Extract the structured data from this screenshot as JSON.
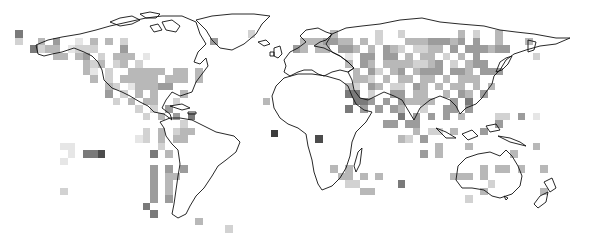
{
  "map": {
    "title": "",
    "projection": "equirectangular world map",
    "legend": null,
    "grid": {
      "cell_size_px": 7.5,
      "origin_px": [
        0,
        0
      ],
      "levels": {
        ".": "#ffffff",
        "1": "#e6e6e6",
        "2": "#d2d2d2",
        "3": "#b8b8b8",
        "4": "#9c9c9c",
        "5": "#7a7a7a",
        "6": "#4c4c4c"
      },
      "rows": [
        "...............................................................................",
        "...............................................................................",
        "...............................................................................",
        "...............................................................................",
        "..5..............................2..........3.....2..2.......3.2..3............",
        "..2..3.4..1.3.3.2...........4...........3334433.3.2...33344434.4..3...3........",
        "....5233.1222...4......................43.33.443.3.432.2233.4.444344...........",
        ".......33.34.2.333.1..........................1.44.44.3.33.2.3.4.......2........",
        "...........323.23.2...........................3.43.33332234.2.344.....................",
        "...........31.2..33333.33.3....................3.42.34.3444.443.444...............",
        "............3.2.33333.333.3....................332.3.33.33.3.333.....................",
        "..............32.133344.......................32.43.22.43.3.33.3.3...................",
        "..............4.2.3.3...3.....................55.2..44.33..3.43.4.................",
        "...............2.3.33..2...........3...........554.4.43333..4.5.........................",
        "..................2.2.4.......................5.4.4.43..2..44.4...............",
        "...................2.3.4.5...........................5.4.4.4.3....22.4.1..........",
        "........................2..........................44.44..........4......................",
        "...................2.3.233.............................3.22.3...4..........",
        "..................12.3.33.................6..........32.4..........................",
        "........11...........2....................................3...3........3...........",
        ".........1.556......5.3.................................4.3.........3..................",
        "........1....................................................................................",
        "....................4.4.4...................3.3.................3.33.3..3..........",
        "....................4.33.....................33.3.3.........333.3..............",
        "....................4.3.......................22.....5...........2....................",
        "........2...........4.3.........................33..............3.......3...........",
        "....................4.4.......................................2.......................",
        "...................5..............................................................",
        "....................5.........................................................",
        "..........................3..........................................................",
        "..............................2..............................................",
        "..............................................................................."
      ]
    },
    "dark_markers": [
      {
        "x": 271,
        "y": 130,
        "size": 7,
        "color": "#3c3c3c"
      }
    ],
    "continents": [
      "North America",
      "Greenland",
      "South America",
      "Europe",
      "Africa",
      "Asia",
      "Australia",
      "New Zealand"
    ]
  }
}
